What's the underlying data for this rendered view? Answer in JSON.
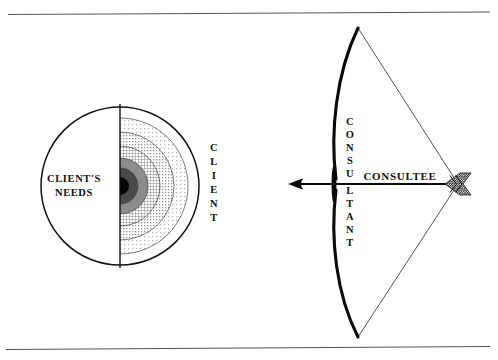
{
  "figure": {
    "background_color": "#ffffff",
    "ink_color": "#111111",
    "frame": {
      "top_rule_label": "top-border-rule",
      "bottom_rule_label": "bottom-border-rule",
      "rule_color": "#555555"
    }
  },
  "left_diagram": {
    "name": "client-needs-circle",
    "center_label": "CLIENT'S NEEDS",
    "center_label_line1": "CLIENT'S",
    "center_label_line2": "NEEDS",
    "outer_label": "CLIENT",
    "outer_label_letters": [
      "C",
      "L",
      "I",
      "E",
      "N",
      "T"
    ],
    "geometry": {
      "center_x": 120,
      "center_y": 186,
      "radius": 79
    },
    "rings": [
      {
        "index": 0,
        "name": "core",
        "radius": 9,
        "fill": "#050505",
        "description": "solid black core"
      },
      {
        "index": 1,
        "name": "ring-1",
        "radius": 18,
        "fill": "#4a4a4a",
        "description": "dark gray band"
      },
      {
        "index": 2,
        "name": "ring-2",
        "radius": 28,
        "fill": "#8c8c8c",
        "description": "medium gray band"
      },
      {
        "index": 3,
        "name": "ring-3",
        "radius": 40,
        "fill": "#b4b4b4",
        "description": "crosshatch band"
      },
      {
        "index": 4,
        "name": "ring-4",
        "radius": 54,
        "fill": "#d8d8d8",
        "description": "light dotted band"
      },
      {
        "index": 5,
        "name": "ring-5",
        "radius": 68,
        "fill": "#efefef",
        "description": "very light dotted band"
      }
    ]
  },
  "right_diagram": {
    "name": "consultant-consultee-bow",
    "bow_label": "CONSULTANT",
    "bow_label_letters": [
      "C",
      "O",
      "N",
      "S",
      "U",
      "L",
      "T",
      "A",
      "N",
      "T"
    ],
    "arrow_label": "CONSULTEE",
    "geometry": {
      "bow_tip_top_x": 358,
      "bow_tip_top_y": 28,
      "bow_tip_bottom_x": 358,
      "bow_tip_bottom_y": 337,
      "grip_x": 336,
      "grip_y": 184,
      "nock_x": 458,
      "nock_y": 184,
      "arrow_tip_x": 288,
      "arrow_tip_y": 184
    }
  }
}
